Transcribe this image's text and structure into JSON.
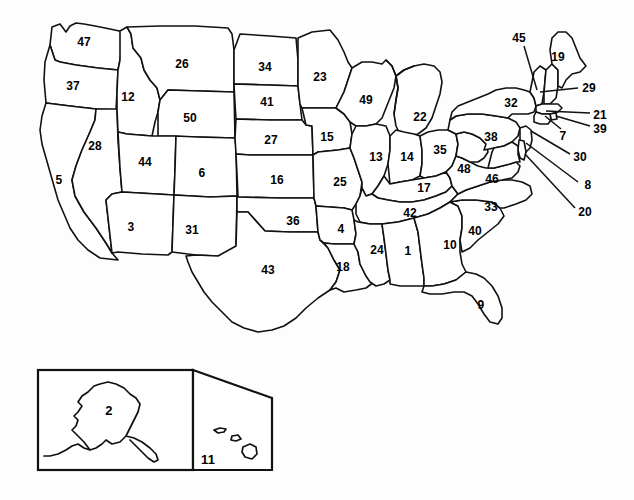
{
  "figure": {
    "width": 634,
    "height": 500,
    "background_color": "#fdfdfd",
    "line_color": "#111111",
    "fill_color": "#ffffff"
  },
  "insets": [
    {
      "name": "alaska-inset",
      "label": "2"
    },
    {
      "name": "hawaii-inset",
      "label": "11"
    }
  ],
  "labels": [
    {
      "id": "label-47",
      "text": "47",
      "x": 84,
      "y": 42,
      "leader": false
    },
    {
      "id": "label-37",
      "text": "37",
      "x": 73,
      "y": 86,
      "leader": false
    },
    {
      "id": "label-12",
      "text": "12",
      "x": 128,
      "y": 97,
      "leader": false
    },
    {
      "id": "label-26",
      "text": "26",
      "x": 182,
      "y": 64,
      "leader": false
    },
    {
      "id": "label-34",
      "text": "34",
      "x": 265,
      "y": 67,
      "leader": false
    },
    {
      "id": "label-23",
      "text": "23",
      "x": 320,
      "y": 77,
      "leader": false
    },
    {
      "id": "label-41",
      "text": "41",
      "x": 267,
      "y": 102,
      "leader": false
    },
    {
      "id": "label-50",
      "text": "50",
      "x": 190,
      "y": 118,
      "leader": false
    },
    {
      "id": "label-28",
      "text": "28",
      "x": 95,
      "y": 146,
      "leader": false
    },
    {
      "id": "label-44",
      "text": "44",
      "x": 145,
      "y": 162,
      "leader": false
    },
    {
      "id": "label-5",
      "text": "5",
      "x": 59,
      "y": 180,
      "leader": false
    },
    {
      "id": "label-6",
      "text": "6",
      "x": 202,
      "y": 173,
      "leader": false
    },
    {
      "id": "label-27",
      "text": "27",
      "x": 271,
      "y": 140,
      "leader": false
    },
    {
      "id": "label-15",
      "text": "15",
      "x": 327,
      "y": 137,
      "leader": false
    },
    {
      "id": "label-16",
      "text": "16",
      "x": 277,
      "y": 180,
      "leader": false
    },
    {
      "id": "label-25",
      "text": "25",
      "x": 340,
      "y": 182,
      "leader": false
    },
    {
      "id": "label-3",
      "text": "3",
      "x": 131,
      "y": 227,
      "leader": false
    },
    {
      "id": "label-31",
      "text": "31",
      "x": 192,
      "y": 230,
      "leader": false
    },
    {
      "id": "label-36",
      "text": "36",
      "x": 293,
      "y": 221,
      "leader": false
    },
    {
      "id": "label-4",
      "text": "4",
      "x": 341,
      "y": 229,
      "leader": false
    },
    {
      "id": "label-43",
      "text": "43",
      "x": 268,
      "y": 270,
      "leader": false
    },
    {
      "id": "label-18",
      "text": "18",
      "x": 343,
      "y": 267,
      "leader": false
    },
    {
      "id": "label-49",
      "text": "49",
      "x": 366,
      "y": 100,
      "leader": false
    },
    {
      "id": "label-22",
      "text": "22",
      "x": 420,
      "y": 117,
      "leader": false
    },
    {
      "id": "label-13",
      "text": "13",
      "x": 376,
      "y": 157,
      "leader": false
    },
    {
      "id": "label-14",
      "text": "14",
      "x": 407,
      "y": 157,
      "leader": false
    },
    {
      "id": "label-35",
      "text": "35",
      "x": 440,
      "y": 150,
      "leader": false
    },
    {
      "id": "label-17",
      "text": "17",
      "x": 424,
      "y": 188,
      "leader": false
    },
    {
      "id": "label-48",
      "text": "48",
      "x": 464,
      "y": 169,
      "leader": false
    },
    {
      "id": "label-46",
      "text": "46",
      "x": 492,
      "y": 179,
      "leader": false
    },
    {
      "id": "label-42",
      "text": "42",
      "x": 410,
      "y": 213,
      "leader": false
    },
    {
      "id": "label-33",
      "text": "33",
      "x": 491,
      "y": 207,
      "leader": false
    },
    {
      "id": "label-40",
      "text": "40",
      "x": 475,
      "y": 231,
      "leader": false
    },
    {
      "id": "label-24",
      "text": "24",
      "x": 377,
      "y": 250,
      "leader": false
    },
    {
      "id": "label-1",
      "text": "1",
      "x": 408,
      "y": 251,
      "leader": false
    },
    {
      "id": "label-10",
      "text": "10",
      "x": 450,
      "y": 245,
      "leader": false
    },
    {
      "id": "label-9",
      "text": "9",
      "x": 481,
      "y": 305,
      "leader": false
    },
    {
      "id": "label-38",
      "text": "38",
      "x": 491,
      "y": 137,
      "leader": false
    },
    {
      "id": "label-32",
      "text": "32",
      "x": 511,
      "y": 103,
      "leader": false
    },
    {
      "id": "label-19",
      "text": "19",
      "x": 558,
      "y": 57,
      "leader": false
    },
    {
      "id": "label-45",
      "text": "45",
      "x": 519,
      "y": 38,
      "leader": true
    },
    {
      "id": "label-29",
      "text": "29",
      "x": 589,
      "y": 88,
      "leader": true
    },
    {
      "id": "label-21",
      "text": "21",
      "x": 600,
      "y": 115,
      "leader": true
    },
    {
      "id": "label-39",
      "text": "39",
      "x": 600,
      "y": 129,
      "leader": true
    },
    {
      "id": "label-7",
      "text": "7",
      "x": 563,
      "y": 136,
      "leader": true
    },
    {
      "id": "label-30",
      "text": "30",
      "x": 580,
      "y": 157,
      "leader": true
    },
    {
      "id": "label-8",
      "text": "8",
      "x": 588,
      "y": 185,
      "leader": true
    },
    {
      "id": "label-20",
      "text": "20",
      "x": 585,
      "y": 212,
      "leader": true
    },
    {
      "id": "label-2",
      "text": "2",
      "x": 109,
      "y": 410,
      "leader": false
    },
    {
      "id": "label-11",
      "text": "11",
      "x": 208,
      "y": 459,
      "leader": false
    }
  ],
  "leader_lines": [
    {
      "name": "leader-45",
      "x1": 524,
      "y1": 46,
      "x2": 537,
      "y2": 90
    },
    {
      "name": "leader-29",
      "x1": 578,
      "y1": 88,
      "x2": 540,
      "y2": 92
    },
    {
      "name": "leader-21",
      "x1": 590,
      "y1": 113,
      "x2": 546,
      "y2": 111
    },
    {
      "name": "leader-39",
      "x1": 590,
      "y1": 126,
      "x2": 539,
      "y2": 113
    },
    {
      "name": "leader-7",
      "x1": 561,
      "y1": 129,
      "x2": 545,
      "y2": 116
    },
    {
      "name": "leader-30",
      "x1": 570,
      "y1": 154,
      "x2": 531,
      "y2": 131
    },
    {
      "name": "leader-8",
      "x1": 578,
      "y1": 182,
      "x2": 526,
      "y2": 143
    },
    {
      "name": "leader-20",
      "x1": 575,
      "y1": 208,
      "x2": 525,
      "y2": 152
    }
  ]
}
